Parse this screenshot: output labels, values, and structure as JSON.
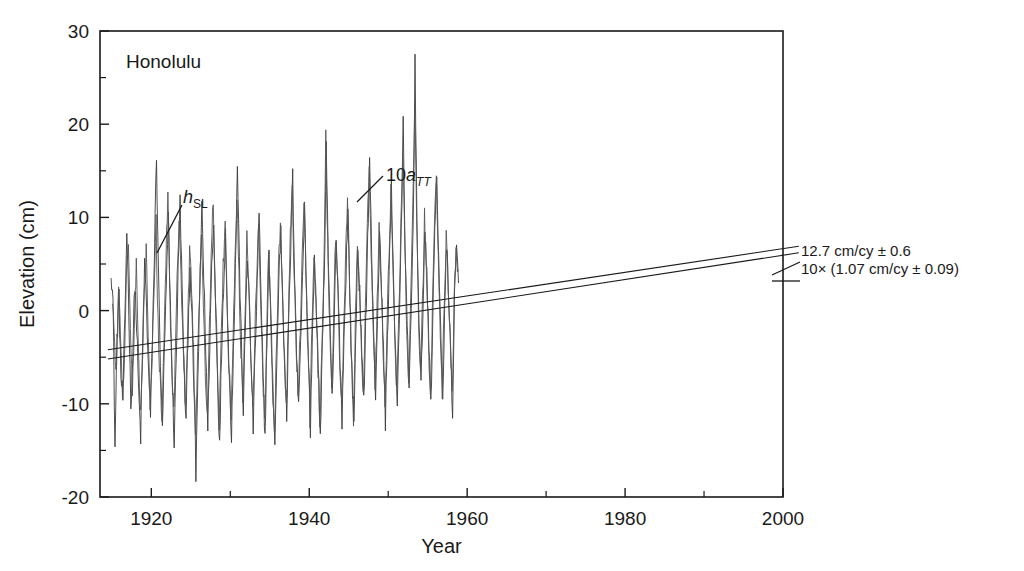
{
  "figure": {
    "panel_label": "Honolulu",
    "background": "#ffffff",
    "ink_color": "#1a1a1a"
  },
  "axes": {
    "y_title": "Elevation (cm)",
    "x_title": "Year",
    "y_ticklabels": [
      "30",
      "20",
      "10",
      "0",
      "-10",
      "-20"
    ],
    "x_ticklabels": [
      "1920",
      "1940",
      "1960",
      "1980",
      "2000"
    ]
  },
  "curve_labels": {
    "sea_level": {
      "base": "h",
      "sub": "SL"
    },
    "air_temp": {
      "prefix": "10",
      "base": "a",
      "sub": "TT"
    }
  },
  "annotations": {
    "line1": "12.7 cm/cy ± 0.6",
    "line2": "10× (1.07 cm/cy ± 0.09)"
  },
  "chart_data": {
    "type": "line",
    "title": "Honolulu",
    "xlabel": "Year",
    "ylabel": "Elevation (cm)",
    "xlim": [
      1913.5,
      2000
    ],
    "ylim": [
      -20,
      30
    ],
    "xticks": [
      1920,
      1940,
      1960,
      1980,
      2000
    ],
    "xticks_minor": [
      1930,
      1950,
      1970,
      1990
    ],
    "yticks": [
      30,
      20,
      10,
      0,
      -10,
      -20
    ],
    "yticks_minor": [
      25,
      15,
      5,
      -5,
      -15
    ],
    "grid": false,
    "legend": "none",
    "series": [
      {
        "name": "h_SL",
        "label": "h_SL",
        "description": "Honolulu relative sea level elevation",
        "units": "cm",
        "color": "#3a3a3a",
        "x_start": 1914.9,
        "x_step": 0.25,
        "values": [
          4.6,
          0.9,
          -14.6,
          -3.2,
          1.2,
          -7.1,
          -9.4,
          -1.0,
          8.8,
          0.2,
          -10.1,
          -4.8,
          3.1,
          -2.0,
          -8.9,
          -13.5,
          -3.6,
          5.1,
          0.4,
          -6.8,
          -11.2,
          -2.2,
          6.3,
          16.9,
          4.0,
          -5.4,
          -13.1,
          -4.4,
          2.3,
          9.9,
          1.0,
          -7.8,
          -14.2,
          -5.0,
          4.5,
          11.9,
          2.0,
          -6.2,
          -12.0,
          -2.6,
          5.0,
          -1.2,
          -8.4,
          -17.6,
          -6.8,
          1.6,
          11.8,
          3.2,
          -4.0,
          -12.8,
          -3.4,
          4.8,
          9.0,
          0.6,
          -7.4,
          -14.8,
          -4.2,
          3.0,
          8.2,
          -0.4,
          -8.0,
          -13.2,
          -3.8,
          4.4,
          15.9,
          5.2,
          -3.4,
          -11.0,
          -2.0,
          6.0,
          1.2,
          -6.0,
          -12.4,
          -4.6,
          2.8,
          10.4,
          0.8,
          -7.0,
          -13.6,
          -2.8,
          5.6,
          -0.8,
          -9.2,
          -14.0,
          -5.6,
          3.6,
          8.6,
          1.4,
          -5.8,
          -11.4,
          -1.4,
          6.8,
          14.2,
          4.2,
          -4.6,
          -10.6,
          -3.0,
          4.0,
          11.0,
          2.4,
          -5.2,
          -12.6,
          -2.4,
          5.4,
          0.2,
          -6.6,
          -13.0,
          -4.0,
          3.4,
          17.8,
          6.2,
          -3.0,
          -9.8,
          -1.8,
          7.2,
          2.2,
          -5.0,
          -11.6,
          -3.2,
          4.2,
          10.8,
          1.8,
          -6.4,
          -12.2,
          -2.2,
          6.6,
          1.6,
          -4.8,
          -10.2,
          -1.2,
          7.4,
          16.6,
          5.8,
          -2.6,
          -9.0,
          -0.6,
          8.0,
          2.6,
          -4.4,
          -11.8,
          -2.8,
          5.2,
          12.8,
          3.8,
          -3.8,
          -9.6,
          -1.0,
          7.8,
          19.8,
          6.6,
          -2.2,
          -8.6,
          -0.2,
          8.4,
          26.4,
          9.2,
          -1.6,
          -8.2,
          0.4,
          9.0,
          3.4,
          -3.6,
          -10.0,
          -0.8,
          8.6,
          15.2,
          5.0,
          -2.8,
          -9.4,
          0.2,
          7.0,
          2.0,
          -4.2,
          -10.8,
          1.2,
          6.4,
          3.0
        ]
      },
      {
        "name": "10a_TT",
        "label": "10a_TT",
        "description": "Ten times air temperature anomaly",
        "units": "cm (10x degC)",
        "color": "#555555",
        "x_start": 1915.1,
        "x_step": 0.25,
        "values": [
          1.8,
          -3.4,
          -6.2,
          2.4,
          -1.8,
          -9.0,
          -5.2,
          3.8,
          7.6,
          -2.4,
          -8.2,
          -1.2,
          5.4,
          -4.2,
          -10.8,
          -6.0,
          1.0,
          7.0,
          -3.0,
          -9.6,
          -4.8,
          2.8,
          9.4,
          -1.6,
          -7.6,
          -12.4,
          -3.4,
          5.8,
          12.0,
          1.4,
          -6.6,
          -11.2,
          -2.8,
          6.2,
          9.6,
          0.8,
          -5.4,
          -10.4,
          -1.8,
          7.2,
          2.4,
          -4.6,
          -13.8,
          -5.8,
          2.0,
          9.2,
          1.2,
          -6.8,
          -11.8,
          -2.0,
          6.8,
          11.4,
          2.2,
          -5.0,
          -12.0,
          -3.6,
          4.6,
          10.2,
          0.4,
          -6.2,
          -11.0,
          -2.4,
          5.8,
          12.6,
          3.4,
          -4.2,
          -10.0,
          -1.4,
          7.6,
          3.0,
          -5.6,
          -11.4,
          -3.0,
          4.0,
          9.8,
          1.6,
          -6.0,
          -12.2,
          -2.6,
          6.4,
          0.6,
          -7.2,
          -12.8,
          -4.2,
          4.8,
          10.0,
          2.0,
          -5.2,
          -10.6,
          -0.8,
          7.8,
          13.0,
          3.2,
          -4.0,
          -9.2,
          -2.2,
          5.2,
          12.2,
          3.0,
          -4.8,
          -11.6,
          -1.6,
          6.0,
          1.0,
          -6.4,
          -12.6,
          -3.8,
          4.4,
          18.2,
          7.0,
          -2.4,
          -9.4,
          -1.0,
          8.2,
          3.6,
          -4.4,
          -10.4,
          -2.4,
          5.6,
          11.2,
          2.6,
          -5.8,
          -11.2,
          -1.2,
          7.4,
          2.8,
          -4.0,
          -9.8,
          -0.4,
          8.8,
          14.8,
          6.0,
          -2.0,
          -8.4,
          0.6,
          9.2,
          3.2,
          -3.8,
          -10.2,
          -2.0,
          6.2,
          13.4,
          4.6,
          -3.2,
          -9.0,
          -0.6,
          8.6,
          17.2,
          7.4,
          -1.8,
          -8.0,
          0.8,
          9.6,
          22.0,
          10.4,
          -1.2,
          -7.4,
          1.0,
          10.0,
          4.2,
          -3.0,
          -9.2,
          -0.2,
          9.4,
          13.8,
          5.6,
          -2.4,
          -8.8,
          0.8,
          7.6,
          2.4,
          -3.6,
          -9.6,
          2.0,
          7.2,
          4.4
        ]
      }
    ],
    "trendlines": [
      {
        "name": "trend_sea_level",
        "label": "12.7 cm/cy ± 0.6",
        "slope_cm_per_century": 12.7,
        "uncertainty": 0.6,
        "x": [
          1914.5,
          2002.0
        ],
        "y": [
          -4.2,
          6.9
        ]
      },
      {
        "name": "trend_air_temp",
        "label": "10× (1.07 cm/cy ± 0.09)",
        "slope_cm_per_century": 10.7,
        "uncertainty": 0.9,
        "x": [
          1914.5,
          2002.0
        ],
        "y": [
          -5.2,
          6.2
        ]
      }
    ],
    "annotations": [
      {
        "name": "sea-level-curve-label",
        "text": "h_SL",
        "x": 1922.5,
        "y": 12.6
      },
      {
        "name": "air-temp-curve-label",
        "text": "10a_TT",
        "x": 1938.5,
        "y": 17.0
      },
      {
        "name": "panel-label",
        "text": "Honolulu",
        "x": 1917.5,
        "y": 27.0
      }
    ]
  }
}
